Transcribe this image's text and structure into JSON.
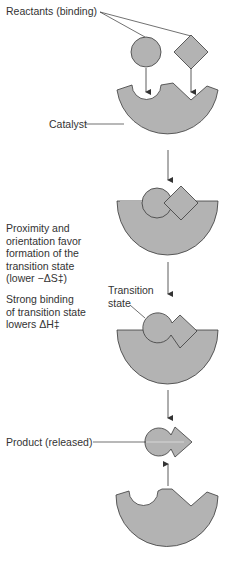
{
  "labels": {
    "reactants": "Reactants (binding)",
    "catalyst": "Catalyst",
    "proximity": [
      "Proximity and",
      "orientation favor",
      "formation of the",
      "transition state",
      "(lower −ΔS‡)"
    ],
    "strong_binding": [
      "Strong binding",
      "of transition state",
      "lowers ΔH‡"
    ],
    "transition_state": [
      "Transition",
      "state"
    ],
    "product": "Product (released)"
  },
  "colors": {
    "fill": "#b3b3b3",
    "stroke": "#3a3a3a",
    "text": "#333333"
  }
}
